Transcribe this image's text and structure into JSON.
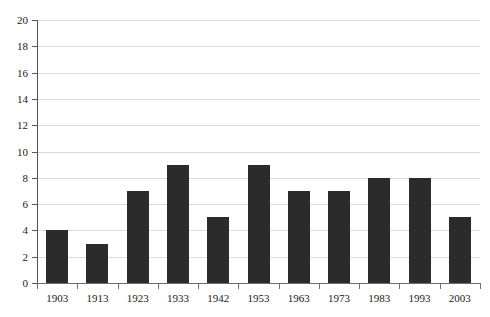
{
  "chart_data": {
    "type": "bar",
    "title": "",
    "subtitle": "",
    "xlabel": "",
    "ylabel": "",
    "categories": [
      "1903",
      "1913",
      "1923",
      "1933",
      "1942",
      "1953",
      "1963",
      "1973",
      "1983",
      "1993",
      "2003"
    ],
    "values": [
      4,
      3,
      7,
      9,
      5,
      9,
      7,
      7,
      8,
      8,
      5
    ],
    "ylim": [
      0,
      20
    ],
    "ytick_step": 2,
    "yticks": [
      "0",
      "2",
      "4",
      "6",
      "8",
      "10",
      "12",
      "14",
      "16",
      "18",
      "20"
    ],
    "grid": true,
    "grid_axis": "y",
    "legend": false,
    "legend_position": "none",
    "bar_color": "#2b2b2b",
    "gridline_color": "#d9d9d9",
    "axis_color": "#6e6e6e",
    "background_color": "#ffffff",
    "annotations": []
  }
}
